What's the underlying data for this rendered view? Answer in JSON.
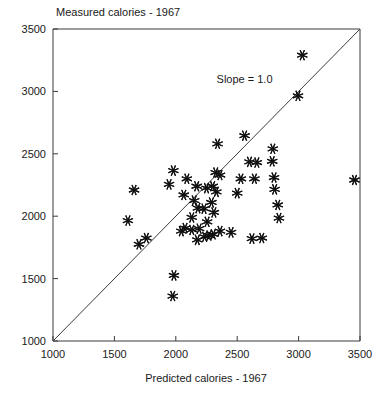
{
  "chart_data": {
    "type": "scatter",
    "title": "Measured calories - 1967",
    "xlabel": "Predicted calories - 1967",
    "ylabel": "Measured calories - 1967",
    "xlim": [
      1000,
      3500
    ],
    "ylim": [
      1000,
      3500
    ],
    "xticks": [
      1000,
      1500,
      2000,
      2500,
      3000,
      3500
    ],
    "yticks": [
      1000,
      1500,
      2000,
      2500,
      3000,
      3500
    ],
    "xtick_labels": [
      "1000",
      "1500",
      "2000",
      "2500",
      "3000",
      "3500"
    ],
    "ytick_labels": [
      "1000",
      "1500",
      "2000",
      "2500",
      "3000",
      "3500"
    ],
    "grid": false,
    "legend": null,
    "marker": "asterisk",
    "annotations": [
      {
        "text": "Slope = 1.0",
        "x": 2560,
        "y": 3070
      }
    ],
    "reference_line": {
      "label": "Slope = 1.0",
      "slope": 1.0,
      "intercept": 0,
      "from": [
        1000,
        1000
      ],
      "to": [
        3500,
        3500
      ]
    },
    "series": [
      {
        "name": "Subjects",
        "points": [
          [
            1660,
            2210
          ],
          [
            1610,
            1965
          ],
          [
            1980,
            2365
          ],
          [
            1945,
            2255
          ],
          [
            2090,
            2300
          ],
          [
            2065,
            2170
          ],
          [
            2170,
            2240
          ],
          [
            2150,
            2125
          ],
          [
            2340,
            2580
          ],
          [
            2325,
            2350
          ],
          [
            2180,
            2065
          ],
          [
            2130,
            1990
          ],
          [
            2230,
            2060
          ],
          [
            2250,
            2225
          ],
          [
            2300,
            2240
          ],
          [
            2330,
            2195
          ],
          [
            2360,
            2330
          ],
          [
            2075,
            1905
          ],
          [
            2045,
            1880
          ],
          [
            2130,
            1890
          ],
          [
            2190,
            1900
          ],
          [
            2255,
            1955
          ],
          [
            2290,
            2110
          ],
          [
            2310,
            2030
          ],
          [
            2175,
            1810
          ],
          [
            2235,
            1835
          ],
          [
            2270,
            1845
          ],
          [
            2305,
            1855
          ],
          [
            2360,
            1880
          ],
          [
            2450,
            1870
          ],
          [
            2500,
            2185
          ],
          [
            2530,
            2300
          ],
          [
            2560,
            2645
          ],
          [
            2600,
            2435
          ],
          [
            2660,
            2430
          ],
          [
            2640,
            2300
          ],
          [
            2620,
            1820
          ],
          [
            2700,
            1825
          ],
          [
            2785,
            2440
          ],
          [
            2790,
            2540
          ],
          [
            2800,
            2310
          ],
          [
            2805,
            2215
          ],
          [
            2830,
            2090
          ],
          [
            2840,
            1985
          ],
          [
            1985,
            1525
          ],
          [
            1975,
            1360
          ],
          [
            1760,
            1825
          ],
          [
            1700,
            1775
          ],
          [
            2995,
            2965
          ],
          [
            3030,
            3290
          ],
          [
            3455,
            2290
          ]
        ]
      }
    ]
  },
  "plot_geometry": {
    "left_px": 53,
    "right_px": 360,
    "top_px": 29,
    "bottom_px": 341,
    "tick_length_px": 5,
    "marker_radius_px": 5.5
  },
  "colors": {
    "axis": "#3b3b3b",
    "marker": "#111111",
    "text": "#1a1a1a",
    "background": "#ffffff"
  }
}
